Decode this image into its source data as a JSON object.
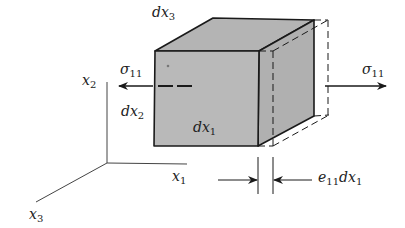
{
  "colors": {
    "face_front": "#b9b9b9",
    "face_top": "#b4b4b4",
    "face_side": "#b0b0b0",
    "stroke": "#1a1a1a",
    "axis": "#444444",
    "background": "#ffffff"
  },
  "labels": {
    "dx3": {
      "base": "dx",
      "sub": "3"
    },
    "dx2": {
      "base": "dx",
      "sub": "2"
    },
    "dx1": {
      "base": "dx",
      "sub": "1"
    },
    "sigma_left": {
      "base": "σ",
      "sub": "11"
    },
    "sigma_right": {
      "base": "σ",
      "sub": "11"
    },
    "axis_x1": {
      "base": "x",
      "sub": "1"
    },
    "axis_x2": {
      "base": "x",
      "sub": "2"
    },
    "axis_x3": {
      "base": "x",
      "sub": "3"
    },
    "elongation": {
      "base": "e",
      "sub": "11",
      "tail": "dx",
      "tail_sub": "1"
    }
  }
}
